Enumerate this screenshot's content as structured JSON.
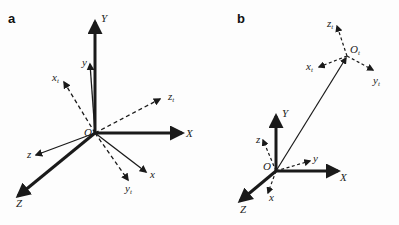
{
  "figure": {
    "panels": [
      {
        "id": "a",
        "label": "a",
        "origin_label": "O",
        "world_axes": {
          "X": "X",
          "Y": "Y",
          "Z": "Z"
        },
        "body_axes": {
          "x": "x",
          "y": "y",
          "z": "z"
        },
        "target_axes": {
          "x_t": "x",
          "y_t": "y",
          "z_t": "z",
          "subscript": "t"
        }
      },
      {
        "id": "b",
        "label": "b",
        "origin_label": "O",
        "target_origin_label": "O",
        "target_origin_subscript": "t",
        "world_axes": {
          "X": "X",
          "Y": "Y",
          "Z": "Z"
        },
        "body_axes": {
          "x": "x",
          "y": "y",
          "z": "z"
        },
        "target_axes": {
          "x_t": "x",
          "y_t": "y",
          "z_t": "z",
          "subscript": "t"
        }
      }
    ],
    "colors": {
      "stroke": "#1a1a1a",
      "background": "#fdfdfd"
    }
  }
}
